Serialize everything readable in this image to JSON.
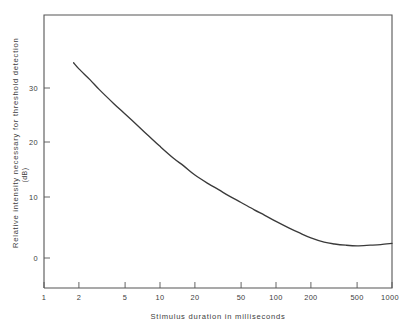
{
  "chart_data": {
    "type": "line",
    "title": "",
    "xlabel": "Stimulus duration in milliseconds",
    "ylabel": "Relative intensity necessary for threshold detection",
    "ylabel_unit": "(dB)",
    "xscale": "log",
    "yscale": "linear",
    "xlim": [
      1,
      1000
    ],
    "ylim": [
      -10,
      42
    ],
    "grid": false,
    "legend": null,
    "xticks": [
      {
        "value": 1,
        "label": "1"
      },
      {
        "value": 2,
        "label": "2"
      },
      {
        "value": 5,
        "label": "5"
      },
      {
        "value": 10,
        "label": "10"
      },
      {
        "value": 20,
        "label": "20"
      },
      {
        "value": 50,
        "label": "50"
      },
      {
        "value": 100,
        "label": "100"
      },
      {
        "value": 200,
        "label": "200"
      },
      {
        "value": 500,
        "label": "500"
      },
      {
        "value": 1000,
        "label": "1000"
      }
    ],
    "yticks": [
      {
        "value": 0,
        "label": "0"
      },
      {
        "value": 10,
        "label": "10"
      },
      {
        "value": 20,
        "label": "20"
      },
      {
        "value": 30,
        "label": "30"
      }
    ],
    "series": [
      {
        "name": "threshold detection curve",
        "x": [
          1.8,
          2.0,
          2.5,
          3.0,
          4.0,
          5.0,
          6.5,
          8.0,
          10.0,
          13.0,
          16.0,
          20.0,
          26.0,
          32.0,
          40.0,
          50.0,
          65.0,
          80.0,
          100.0,
          130.0,
          160.0,
          200.0,
          260.0,
          320.0,
          400.0,
          500.0,
          650.0,
          800.0,
          1000.0
        ],
        "y": [
          32.0,
          31.0,
          29.2,
          27.6,
          25.3,
          23.6,
          21.6,
          20.0,
          18.3,
          16.4,
          15.1,
          13.6,
          12.2,
          11.2,
          10.1,
          9.1,
          7.9,
          7.0,
          6.0,
          4.9,
          4.1,
          3.3,
          2.6,
          2.3,
          2.1,
          2.0,
          2.1,
          2.2,
          2.4
        ]
      }
    ]
  },
  "axes": {
    "x_title": "Stimulus duration in milliseconds",
    "y_title": "Relative intensity necessary for threshold detection",
    "y_unit": "(dB)"
  }
}
